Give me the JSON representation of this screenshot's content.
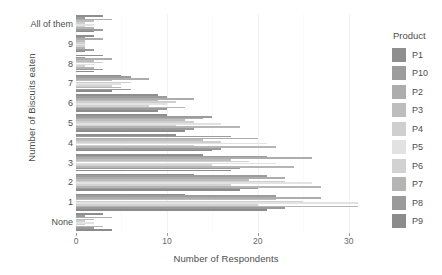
{
  "chart_data": {
    "type": "bar",
    "orientation": "horizontal",
    "grouped": true,
    "title": "",
    "xlabel": "Number of Respondents",
    "ylabel": "Number of Biscuits eaten",
    "xlim": [
      0,
      33
    ],
    "xticks": [
      0,
      10,
      20,
      30
    ],
    "xtick_labels": [
      "0",
      "10",
      "20",
      "30"
    ],
    "grid": true,
    "legend": {
      "title": "Product",
      "position": "right",
      "entries": [
        "P1",
        "P10",
        "P2",
        "P3",
        "P4",
        "P5",
        "P6",
        "P7",
        "P8",
        "P9"
      ]
    },
    "colors": {
      "P1": "#8e8e8e",
      "P10": "#9c9c9c",
      "P2": "#adadad",
      "P3": "#bdbdbd",
      "P4": "#cfcfcf",
      "P5": "#e2e2e2",
      "P6": "#d2d2d2",
      "P7": "#b5b5b5",
      "P8": "#9a9a9a",
      "P9": "#8c8c8c"
    },
    "categories": [
      "All of them",
      "9",
      "8",
      "7",
      "6",
      "5",
      "4",
      "3",
      "2",
      "1",
      "None"
    ],
    "series": [
      {
        "name": "P1",
        "values": [
          3,
          2,
          3,
          5,
          9,
          10,
          11,
          14,
          13,
          12,
          3
        ]
      },
      {
        "name": "P10",
        "values": [
          1,
          1,
          1,
          6,
          10,
          15,
          17,
          21,
          21,
          22,
          1
        ]
      },
      {
        "name": "P2",
        "values": [
          4,
          3,
          4,
          8,
          13,
          14,
          20,
          26,
          23,
          27,
          4
        ]
      },
      {
        "name": "P3",
        "values": [
          2,
          1,
          2,
          4,
          9,
          12,
          14,
          17,
          19,
          22,
          2
        ]
      },
      {
        "name": "P4",
        "values": [
          1,
          1,
          3,
          6,
          11,
          13,
          16,
          19,
          23,
          25,
          1
        ]
      },
      {
        "name": "P5",
        "values": [
          2,
          1,
          2,
          5,
          10,
          16,
          21,
          22,
          26,
          31,
          2
        ]
      },
      {
        "name": "P6",
        "values": [
          1,
          1,
          1,
          4,
          8,
          11,
          13,
          15,
          17,
          20,
          1
        ]
      },
      {
        "name": "P7",
        "values": [
          2,
          1,
          2,
          5,
          12,
          18,
          22,
          24,
          27,
          31,
          3
        ]
      },
      {
        "name": "P8",
        "values": [
          3,
          2,
          3,
          6,
          10,
          13,
          16,
          18,
          20,
          23,
          2
        ]
      },
      {
        "name": "P9",
        "values": [
          2,
          1,
          2,
          4,
          9,
          12,
          15,
          17,
          18,
          21,
          4
        ]
      }
    ]
  }
}
